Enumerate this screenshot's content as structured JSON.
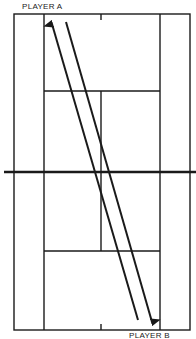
{
  "diagram": {
    "type": "tennis-court-shot-diagram",
    "labels": {
      "top_player": "PLAYER A",
      "bottom_player": "PLAYER B"
    },
    "colors": {
      "line": "#1a1a1a",
      "background": "#ffffff"
    },
    "arrows": [
      {
        "from": "bottom",
        "to": "top",
        "description": "shot travelling toward Player A"
      },
      {
        "from": "top",
        "to": "bottom",
        "description": "shot travelling toward Player B"
      }
    ]
  }
}
